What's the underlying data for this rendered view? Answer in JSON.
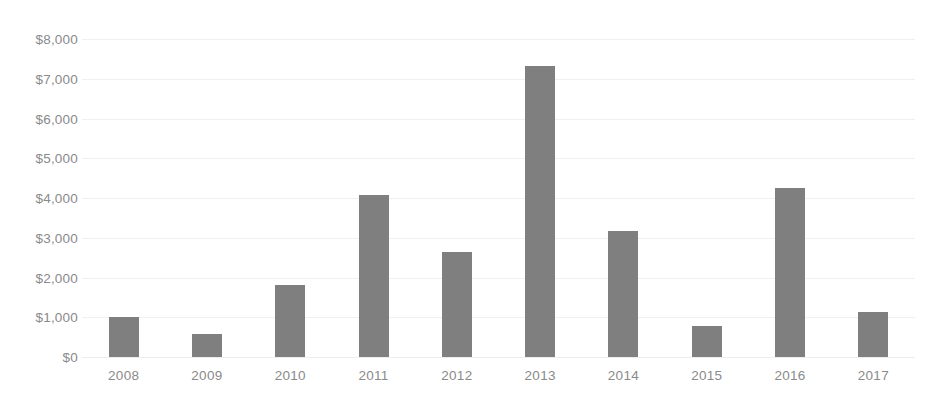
{
  "chart_data": {
    "type": "bar",
    "title": "",
    "subtitle": "",
    "xlabel": "",
    "ylabel": "",
    "categories": [
      "2008",
      "2009",
      "2010",
      "2011",
      "2012",
      "2013",
      "2014",
      "2015",
      "2016",
      "2017"
    ],
    "values": [
      1000,
      580,
      1800,
      4080,
      2650,
      7320,
      3180,
      780,
      4260,
      1120
    ],
    "ylim": [
      0,
      8000
    ],
    "ytick_values": [
      0,
      1000,
      2000,
      3000,
      4000,
      5000,
      6000,
      7000,
      8000
    ],
    "ytick_labels": [
      "$0",
      "$1,000",
      "$2,000",
      "$3,000",
      "$4,000",
      "$5,000",
      "$6,000",
      "$7,000",
      "$8,000"
    ],
    "grid": true,
    "legend": false,
    "legend_position": "none",
    "series": [
      {
        "name": "",
        "color": "#7f7f7f",
        "values": [
          1000,
          580,
          1800,
          4080,
          2650,
          7320,
          3180,
          780,
          4260,
          1120
        ]
      }
    ],
    "annotations": []
  },
  "style": {
    "bar_color": "#7f7f7f",
    "gridline_color": "#f0f0f0",
    "axis_text_color": "#8a8a8a",
    "background_color": "#ffffff"
  }
}
